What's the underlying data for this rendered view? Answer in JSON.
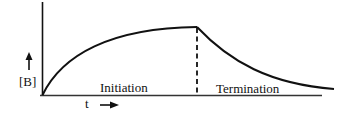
{
  "diagram": {
    "y_axis_label": "[B]",
    "x_axis_label": "t",
    "regions": [
      {
        "label": "Initiation"
      },
      {
        "label": "Termination"
      }
    ],
    "colors": {
      "stroke": "#111111",
      "background": "#ffffff"
    }
  }
}
